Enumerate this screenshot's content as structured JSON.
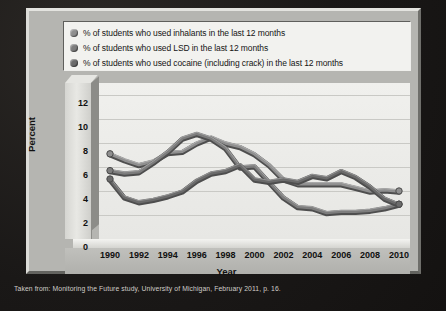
{
  "legend": {
    "items": [
      {
        "label": "% of students who used inhalants in the last 12 months",
        "color": "#8f8f8f",
        "series": "inhalants"
      },
      {
        "label": "% of students who used LSD in the last 12 months",
        "color": "#7d7d7d",
        "series": "lsd"
      },
      {
        "label": "% of students who used cocaine (including crack) in the last 12 months",
        "color": "#6b6b6b",
        "series": "cocaine"
      }
    ]
  },
  "footer": {
    "text": "Taken from: Monitoring the Future study, University of Michigan, February 2011, p. 16."
  },
  "chart_data": {
    "type": "line",
    "title": "",
    "xlabel": "Year",
    "ylabel": "Percent",
    "xlim": [
      1990,
      2010
    ],
    "ylim": [
      0,
      13
    ],
    "yticks": [
      0,
      2,
      4,
      6,
      8,
      10,
      12
    ],
    "xticks": [
      1990,
      1992,
      1994,
      1996,
      1998,
      2000,
      2002,
      2004,
      2006,
      2008,
      2010
    ],
    "grid": true,
    "legend_position": "top",
    "x": [
      1990,
      1991,
      1992,
      1993,
      1994,
      1995,
      1996,
      1997,
      1998,
      1999,
      2000,
      2001,
      2002,
      2003,
      2004,
      2005,
      2006,
      2007,
      2008,
      2009,
      2010
    ],
    "series": [
      {
        "name": "% of students who used inhalants in the last 12 months",
        "color": "#8f8f8f",
        "values": [
          7.1,
          6.6,
          6.2,
          6.5,
          7.2,
          7.3,
          8.0,
          8.5,
          8.0,
          7.7,
          7.1,
          6.2,
          5.0,
          4.6,
          4.6,
          4.6,
          4.6,
          4.3,
          4.0,
          4.1,
          4.0
        ]
      },
      {
        "name": "% of students who used LSD in the last 12 months",
        "color": "#7d7d7d",
        "values": [
          5.7,
          5.5,
          5.6,
          6.4,
          7.3,
          8.4,
          8.8,
          8.4,
          7.6,
          6.0,
          6.1,
          4.8,
          3.5,
          2.7,
          2.6,
          2.2,
          2.3,
          2.3,
          2.4,
          2.6,
          2.9
        ]
      },
      {
        "name": "% of students who used cocaine (including crack) in the last 12 months",
        "color": "#6b6b6b",
        "values": [
          5.0,
          3.5,
          3.1,
          3.3,
          3.6,
          4.0,
          4.9,
          5.5,
          5.7,
          6.2,
          5.0,
          4.8,
          5.0,
          4.8,
          5.3,
          5.1,
          5.7,
          5.2,
          4.4,
          3.4,
          2.9
        ]
      }
    ],
    "endpoint_markers": true
  }
}
